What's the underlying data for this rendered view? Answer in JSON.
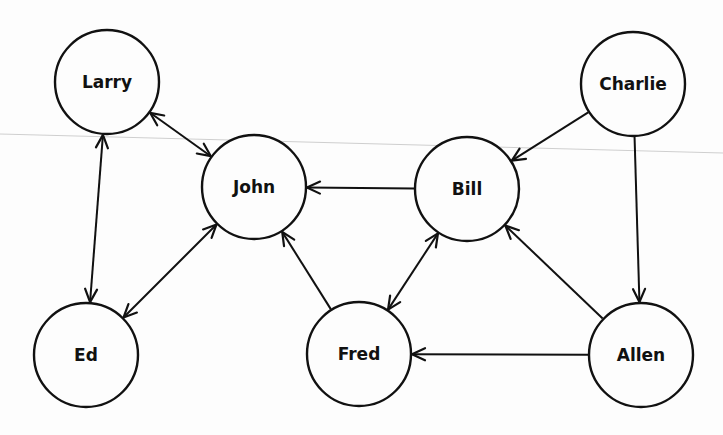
{
  "diagram": {
    "type": "directed-graph",
    "nodes": [
      {
        "id": "larry",
        "label": "Larry",
        "x": 107,
        "y": 82
      },
      {
        "id": "john",
        "label": "John",
        "x": 254,
        "y": 187
      },
      {
        "id": "charlie",
        "label": "Charlie",
        "x": 633,
        "y": 84
      },
      {
        "id": "bill",
        "label": "Bill",
        "x": 467,
        "y": 189
      },
      {
        "id": "ed",
        "label": "Ed",
        "x": 86,
        "y": 355
      },
      {
        "id": "fred",
        "label": "Fred",
        "x": 359,
        "y": 354
      },
      {
        "id": "allen",
        "label": "Allen",
        "x": 641,
        "y": 355
      }
    ],
    "node_radius": 52,
    "edges": [
      {
        "from": "larry",
        "to": "john",
        "bidirectional": true
      },
      {
        "from": "larry",
        "to": "ed",
        "bidirectional": true
      },
      {
        "from": "john",
        "to": "ed",
        "bidirectional": true
      },
      {
        "from": "bill",
        "to": "john",
        "bidirectional": false
      },
      {
        "from": "fred",
        "to": "john",
        "bidirectional": false
      },
      {
        "from": "charlie",
        "to": "bill",
        "bidirectional": false
      },
      {
        "from": "charlie",
        "to": "allen",
        "bidirectional": false
      },
      {
        "from": "bill",
        "to": "fred",
        "bidirectional": true
      },
      {
        "from": "allen",
        "to": "bill",
        "bidirectional": false
      },
      {
        "from": "allen",
        "to": "fred",
        "bidirectional": false
      }
    ],
    "colors": {
      "stroke": "#111111",
      "background": "#fdfdfd",
      "scanline": "#cfcfcf"
    }
  }
}
